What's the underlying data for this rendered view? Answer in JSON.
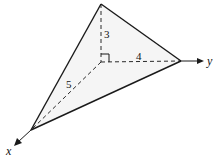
{
  "diagram": {
    "type": "3d-tetrahedron-axes",
    "axes": {
      "x_label": "x",
      "y_label": "y"
    },
    "edges": {
      "vertical": "3",
      "horizontal_y": "4",
      "horizontal_x": "5"
    },
    "right_angle_marker": true,
    "vertices": {
      "origin": [
        101,
        62
      ],
      "top": [
        101,
        4
      ],
      "y_vertex": [
        181,
        61
      ],
      "x_vertex": [
        31,
        130
      ]
    },
    "colors": {
      "line": "#1a1a1a",
      "face": "#ececec"
    }
  }
}
